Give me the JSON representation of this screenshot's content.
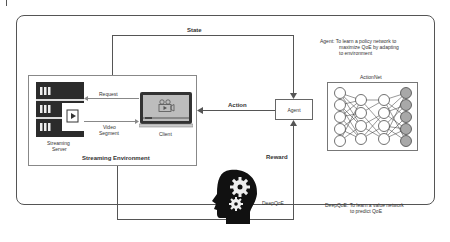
{
  "diagram": {
    "labels": {
      "state": "State",
      "action": "Action",
      "reward": "Reward",
      "request": "Request",
      "video_segment_line1": "Video",
      "video_segment_line2": "Segment",
      "client": "Client",
      "server_line1": "Streaming",
      "server_line2": "Server",
      "environment": "Streaming Environment",
      "agent": "Agent",
      "actionnet": "ActionNet",
      "deepqoe": "DeepQoE"
    },
    "notes": {
      "agent_line1": "Agent:  To learn a policy network to",
      "agent_line2": "maximize QoE by adapting",
      "agent_line3": "to environment",
      "deepqoe_line1": "DeepQoE:  To learn a value network",
      "deepqoe_line2": "to predict QoE"
    },
    "icons": {
      "server": "server-rack-icon",
      "client": "laptop-video-icon",
      "brain": "head-gears-icon",
      "network": "neural-network-icon"
    },
    "colors": {
      "line": "#555555",
      "server_dark": "#2b2b2b",
      "output_neuron": "#a8a8a8",
      "head": "#111111"
    }
  }
}
